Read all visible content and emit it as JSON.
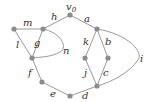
{
  "graph": {
    "nodes": [
      {
        "id": "v0",
        "x": 70,
        "y": 15
      },
      {
        "id": "p1",
        "x": 14,
        "y": 29
      },
      {
        "id": "p2",
        "x": 43,
        "y": 29
      },
      {
        "id": "p3",
        "x": 32,
        "y": 58
      },
      {
        "id": "p4",
        "x": 42,
        "y": 82
      },
      {
        "id": "p5",
        "x": 70,
        "y": 96
      },
      {
        "id": "p6",
        "x": 97,
        "y": 29
      },
      {
        "id": "p7",
        "x": 85,
        "y": 58
      },
      {
        "id": "p8",
        "x": 108,
        "y": 58
      },
      {
        "id": "p9",
        "x": 97,
        "y": 86
      }
    ],
    "edges": [
      {
        "label": "h",
        "from": "v0",
        "to": "p2"
      },
      {
        "label": "a",
        "from": "v0",
        "to": "p6"
      },
      {
        "label": "m",
        "from": "p1",
        "to": "p2"
      },
      {
        "label": "l",
        "from": "p1",
        "to": "p3"
      },
      {
        "label": "g",
        "from": "p2",
        "to": "p3"
      },
      {
        "label": "n",
        "from": "p2",
        "to": "p3",
        "curved": true
      },
      {
        "label": "f",
        "from": "p3",
        "to": "p4"
      },
      {
        "label": "e",
        "from": "p4",
        "to": "p5"
      },
      {
        "label": "d",
        "from": "p5",
        "to": "p9"
      },
      {
        "label": "k",
        "from": "p6",
        "to": "p7"
      },
      {
        "label": "b",
        "from": "p6",
        "to": "p8"
      },
      {
        "label": "j",
        "from": "p7",
        "to": "p9"
      },
      {
        "label": "c",
        "from": "p8",
        "to": "p9"
      },
      {
        "label": "i",
        "from": "p6",
        "to": "p9",
        "curved": true
      }
    ]
  },
  "labels": {
    "v0": "v",
    "v0_sub": "0",
    "h": "h",
    "a": "a",
    "m": "m",
    "l": "l",
    "g": "g",
    "n": "n",
    "f": "f",
    "e": "e",
    "d": "d",
    "k": "k",
    "b": "b",
    "j": "j",
    "c": "c",
    "i": "i"
  }
}
